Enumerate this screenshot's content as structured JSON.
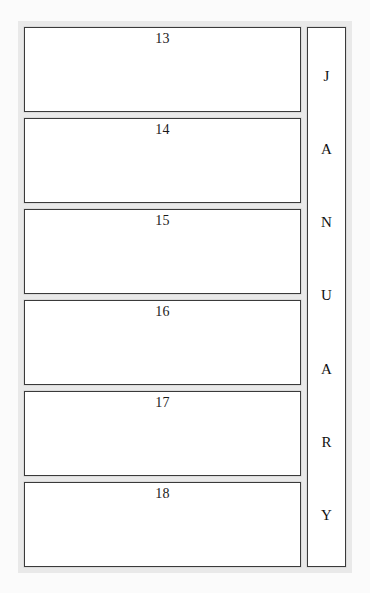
{
  "page": {
    "type": "weekly-planner-page",
    "month_label": "JANUARY",
    "frame_color": "#e9e9e9",
    "cell_border_color": "#3a3a3a",
    "cell_background": "#ffffff",
    "page_background": "#fbfbfb",
    "text_color": "#1a1a1a"
  },
  "day_cells": [
    {
      "number": "13",
      "note": ""
    },
    {
      "number": "14",
      "note": ""
    },
    {
      "number": "15",
      "note": ""
    },
    {
      "number": "16",
      "note": ""
    },
    {
      "number": "17",
      "note": ""
    },
    {
      "number": "18",
      "note": ""
    }
  ],
  "month_tab": {
    "letters": [
      "J",
      "A",
      "N",
      "U",
      "A",
      "R",
      "Y"
    ]
  }
}
